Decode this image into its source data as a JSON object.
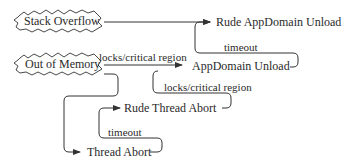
{
  "diagram": {
    "sources": [
      {
        "id": "stack-overflow",
        "label": "Stack Overflow"
      },
      {
        "id": "out-of-memory",
        "label": "Out of Memory"
      }
    ],
    "states": [
      {
        "id": "rude-appdomain-unload",
        "label": "Rude AppDomain Unload"
      },
      {
        "id": "appdomain-unload",
        "label": "AppDomain Unload"
      },
      {
        "id": "rude-thread-abort",
        "label": "Rude Thread Abort"
      },
      {
        "id": "thread-abort",
        "label": "Thread Abort"
      }
    ],
    "edges": [
      {
        "from": "stack-overflow",
        "to": "rude-appdomain-unload",
        "label": ""
      },
      {
        "from": "out-of-memory",
        "to": "appdomain-unload",
        "label": "locks/critical region"
      },
      {
        "from": "appdomain-unload",
        "to": "rude-appdomain-unload",
        "label": "timeout"
      },
      {
        "from": "out-of-memory",
        "to": "thread-abort",
        "label": ""
      },
      {
        "from": "thread-abort",
        "to": "rude-thread-abort",
        "label": "timeout"
      },
      {
        "from": "rude-thread-abort",
        "to": "appdomain-unload",
        "label": "locks/critical region"
      }
    ]
  }
}
